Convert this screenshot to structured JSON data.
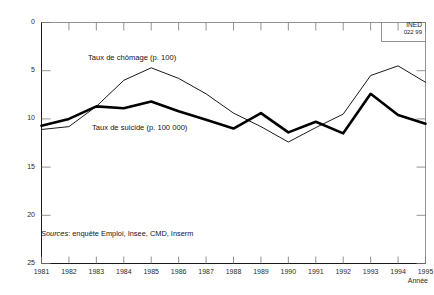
{
  "chart_data": {
    "type": "line",
    "title": "",
    "subtitle": "",
    "xlabel": "Année",
    "ylabel": "",
    "xlim": [
      1981,
      1995
    ],
    "ylim": [
      0,
      25
    ],
    "yticks": [
      0,
      5,
      10,
      15,
      20,
      25
    ],
    "grid": false,
    "legend_position": "inline-annotation",
    "categories": [
      1981,
      1982,
      1983,
      1984,
      1985,
      1986,
      1987,
      1988,
      1989,
      1990,
      1991,
      1992,
      1993,
      1994,
      1995
    ],
    "x": [
      "1981",
      "1982",
      "1983",
      "1984",
      "1985",
      "1986",
      "1987",
      "1988",
      "1989",
      "1990",
      "1991",
      "1992",
      "1993",
      "1994",
      "1995"
    ],
    "series": [
      {
        "name": "Taux de chômage (p. 100)",
        "style": "thin",
        "color": "#000000",
        "values": [
          13.9,
          14.2,
          16.3,
          19.0,
          20.3,
          19.2,
          17.6,
          15.6,
          14.2,
          12.6,
          14.1,
          15.5,
          19.5,
          20.5,
          18.8
        ]
      },
      {
        "name": "Taux de suicide (p. 100 000)",
        "style": "thick",
        "color": "#000000",
        "values": [
          14.3,
          15.0,
          16.3,
          16.1,
          16.8,
          15.8,
          14.9,
          14.0,
          15.6,
          13.6,
          14.7,
          13.5,
          17.6,
          15.4,
          14.5
        ]
      }
    ],
    "annotations": [
      {
        "id": "chomage",
        "text": "Taux de chômage (p. 100)"
      },
      {
        "id": "suicide",
        "text": "Taux de suicide (p. 100 000)"
      }
    ]
  },
  "axes": {
    "y_tick_labels": [
      "25",
      "20",
      "15",
      "10",
      "5",
      "0"
    ],
    "x_tick_labels": [
      "1981",
      "1982",
      "1983",
      "1984",
      "1985",
      "1986",
      "1987",
      "1988",
      "1989",
      "1990",
      "1991",
      "1992",
      "1993",
      "1994",
      "1995"
    ],
    "x_axis_title": "Année"
  },
  "notes": {
    "sources_keyword": "Sources",
    "sources_rest": ": enquête Emploi, Insee, CMD, Inserm"
  },
  "credit": {
    "institute": "INED",
    "code": "022 99"
  }
}
